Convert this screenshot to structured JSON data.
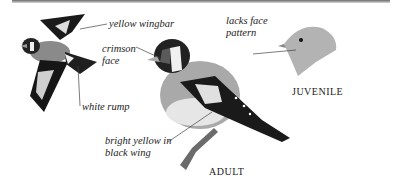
{
  "figure": {
    "labels": {
      "yellow_wingbar": "yellow wingbar",
      "crimson_face_1": "crimson",
      "crimson_face_2": "face",
      "white_rump": "white rump",
      "bright_yellow_1": "bright yellow in",
      "bright_yellow_2": "black wing",
      "lacks_face_1": "lacks face",
      "lacks_face_2": "pattern"
    },
    "captions": {
      "adult": "ADULT",
      "juvenile": "JUVENILE"
    }
  }
}
